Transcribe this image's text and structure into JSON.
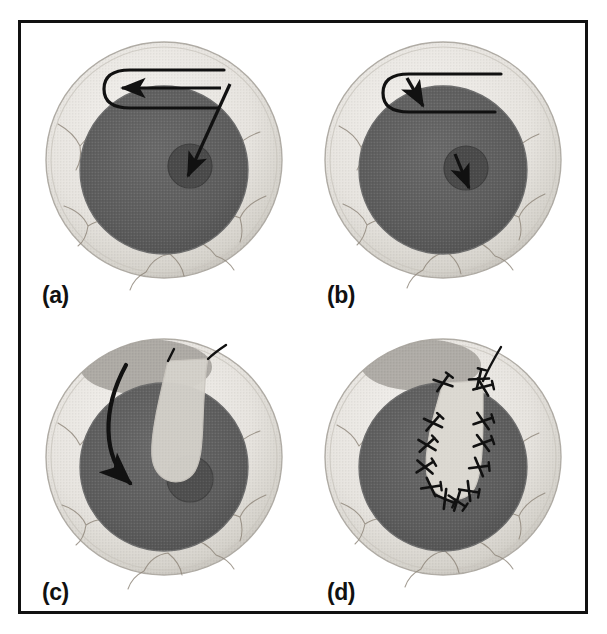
{
  "figure": {
    "domain": "medical-surgical-diagram",
    "background_color": "#ffffff",
    "frame": {
      "border_color": "#111111",
      "border_width_px": 3,
      "inset_px": 18
    },
    "layout": {
      "rows": 2,
      "columns": 2,
      "panel_count": 4
    }
  },
  "colors": {
    "sclera_light": "#eceae6",
    "sclera_shadow": "#d8d5cf",
    "sclera_edge": "#b6b2ab",
    "iris_dark": "#5d5d5d",
    "iris_edge": "#6e6e6e",
    "pupil_spot": "#4a4a4a",
    "vessel": "#8d8478",
    "flap_fill": "#d6d3cc",
    "donor_site": "#a8a5a0",
    "ink_black": "#111111",
    "label_text": "#111111"
  },
  "panels": [
    {
      "id": "a",
      "label": "(a)",
      "stage": "marking-and-incision",
      "description": "Eye with a hairpin (U-shaped) outline drawn on the superior sclera, a leftward arrow inside the outline, and a long diagonal arrow running from the upper-right of the outline down to the central pupil spot.",
      "annotations": [
        {
          "name": "incision-outline",
          "shape": "hairpin-u",
          "location": "superior-sclera"
        },
        {
          "name": "direction-arrow-horizontal",
          "direction": "left",
          "location": "inside-outline"
        },
        {
          "name": "pointer-arrow-diagonal",
          "direction": "down-left",
          "from": "outline-upper-right",
          "to": "pupil-spot"
        }
      ]
    },
    {
      "id": "b",
      "label": "(b)",
      "stage": "flap-initiation",
      "description": "Same eye and hairpin outline; a short arrow points down-right at the left bend of the outline, and a small arrow points down-right within the pupil spot.",
      "annotations": [
        {
          "name": "incision-outline",
          "shape": "hairpin-u",
          "location": "superior-sclera"
        },
        {
          "name": "direction-arrow-short",
          "direction": "down-right",
          "location": "outline-left-bend"
        },
        {
          "name": "pupil-arrow",
          "direction": "down-right",
          "location": "pupil-spot"
        }
      ]
    },
    {
      "id": "c",
      "label": "(c)",
      "stage": "flap-rotation",
      "description": "A pale U-shaped tongue of tissue is rotated downward over the dark iris; a bold curved arrow sweeps from the upper left down to the displaced pupil spot, and a darker crescent marks the donor bed in the superior sclera.",
      "annotations": [
        {
          "name": "rotated-flap",
          "shape": "u-tongue",
          "fill": "light-gray"
        },
        {
          "name": "donor-site",
          "shape": "oval-crescent",
          "location": "superior-sclera"
        },
        {
          "name": "rotation-arrow",
          "direction": "curved-clockwise",
          "to": "pupil-spot"
        },
        {
          "name": "pupil-spot",
          "position": "displaced-right"
        }
      ]
    },
    {
      "id": "d",
      "label": "(d)",
      "stage": "suturing",
      "description": "The flap is seated over the defect and secured with interrupted X-shaped sutures around its entire perimeter; a suture thread tail extends up and to the right, and the donor crescent remains visible superiorly.",
      "annotations": [
        {
          "name": "sutured-flap",
          "shape": "u-tongue",
          "fill": "light-gray"
        },
        {
          "name": "suture-stitches",
          "count": 13,
          "style": "interrupted-x"
        },
        {
          "name": "suture-thread-tail",
          "direction": "up-right"
        },
        {
          "name": "donor-site",
          "shape": "oval-crescent",
          "location": "superior-sclera"
        }
      ]
    }
  ]
}
